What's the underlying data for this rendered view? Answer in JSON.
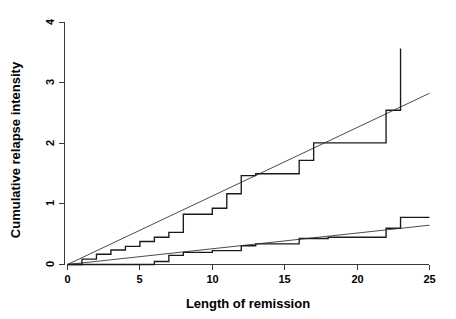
{
  "chart_data": {
    "type": "line",
    "title": "",
    "xlabel": "Length of remission",
    "ylabel": "Cumulative relapse intensity",
    "xlim": [
      0,
      25
    ],
    "ylim": [
      0,
      4
    ],
    "xticks": [
      0,
      5,
      10,
      15,
      20,
      25
    ],
    "xtick_labels": [
      "0",
      "5",
      "10",
      "15",
      "20",
      "25"
    ],
    "yticks": [
      0,
      1,
      2,
      3,
      4
    ],
    "ytick_labels": [
      "0",
      "1",
      "2",
      "3",
      "4"
    ],
    "grid": false,
    "legend": false,
    "series": [
      {
        "name": "upper-step-curve",
        "style": "step",
        "color": "#1a1a1a",
        "x": [
          0,
          1,
          1,
          2,
          2,
          3,
          3,
          4,
          4,
          5,
          5,
          6,
          6,
          7,
          7,
          8,
          8,
          10,
          10,
          11,
          11,
          12,
          12,
          13,
          13,
          16,
          16,
          17,
          17,
          22,
          22,
          23,
          23
        ],
        "y": [
          0,
          0,
          0.09,
          0.09,
          0.17,
          0.17,
          0.24,
          0.24,
          0.3,
          0.3,
          0.38,
          0.38,
          0.45,
          0.45,
          0.53,
          0.53,
          0.83,
          0.83,
          0.93,
          0.93,
          1.17,
          1.17,
          1.47,
          1.47,
          1.5,
          1.5,
          1.72,
          1.72,
          2.01,
          2.01,
          2.55,
          2.55,
          3.57
        ]
      },
      {
        "name": "lower-step-curve",
        "style": "step",
        "color": "#1a1a1a",
        "x": [
          0,
          6,
          6,
          7,
          7,
          8,
          8,
          10,
          10,
          12,
          12,
          13,
          13,
          16,
          16,
          18,
          18,
          22,
          22,
          23,
          23,
          25
        ],
        "y": [
          0,
          0,
          0.05,
          0.05,
          0.15,
          0.15,
          0.2,
          0.2,
          0.23,
          0.23,
          0.31,
          0.31,
          0.34,
          0.34,
          0.43,
          0.43,
          0.45,
          0.45,
          0.6,
          0.6,
          0.78,
          0.78
        ]
      },
      {
        "name": "upper-reference-line",
        "style": "straight",
        "color": "#2a2a2a",
        "x": [
          0,
          25
        ],
        "y": [
          0,
          2.83
        ]
      },
      {
        "name": "lower-reference-line",
        "style": "straight",
        "color": "#2a2a2a",
        "x": [
          0,
          25
        ],
        "y": [
          0,
          0.65
        ]
      }
    ]
  },
  "axes": {
    "x_axis_name": "x-axis",
    "y_axis_name": "y-axis"
  }
}
